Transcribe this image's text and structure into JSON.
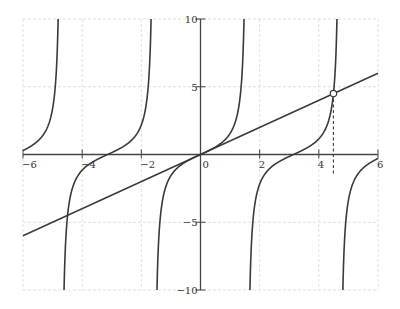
{
  "chart_data": {
    "type": "line",
    "title": "",
    "xlabel": "",
    "ylabel": "",
    "xlim": [
      -6,
      6
    ],
    "ylim": [
      -10,
      10
    ],
    "grid": true,
    "x_ticks": [
      "-6",
      "-4",
      "-2",
      "0",
      "2",
      "4",
      "6"
    ],
    "y_ticks": [
      "10",
      "5",
      "-5",
      "-10"
    ],
    "series": [
      {
        "name": "y = tan(x)",
        "function": "tan",
        "asymptotes": [
          -4.712,
          -1.571,
          1.571,
          4.712
        ]
      },
      {
        "name": "y = x",
        "function": "identity",
        "x": [
          -6,
          6
        ],
        "y": [
          -6,
          6
        ]
      }
    ],
    "annotations": [
      {
        "type": "open-point",
        "x": 4.493,
        "y": 4.493,
        "label": ""
      },
      {
        "type": "dashed-drop-line",
        "x": 4.493,
        "from_y": 4.493,
        "to_y": -1.5
      }
    ],
    "colors": {
      "curve": "#3a3a3a",
      "grid": "#d8d8d8",
      "axis": "#444444"
    }
  }
}
